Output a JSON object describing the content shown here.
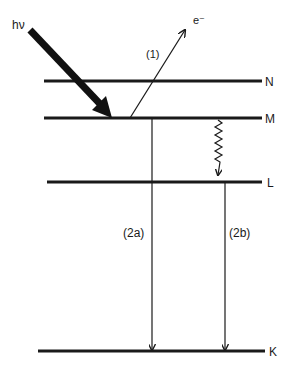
{
  "diagram": {
    "type": "atomic-energy-level-diagram",
    "photon": {
      "label": "hν"
    },
    "electron": {
      "label": "e⁻",
      "process_label": "(1)"
    },
    "levels": [
      {
        "id": "N",
        "label": "N"
      },
      {
        "id": "M",
        "label": "M"
      },
      {
        "id": "L",
        "label": "L"
      },
      {
        "id": "K",
        "label": "K"
      }
    ],
    "transitions": [
      {
        "id": "2a",
        "label": "(2a)",
        "from": "M",
        "to": "K"
      },
      {
        "id": "2b",
        "label": "(2b)",
        "from": "L",
        "to": "K"
      },
      {
        "id": "nonradiative",
        "label": "",
        "from": "M",
        "to": "L"
      }
    ],
    "colors": {
      "ink": "#1a1a1a",
      "background": "#ffffff"
    }
  }
}
